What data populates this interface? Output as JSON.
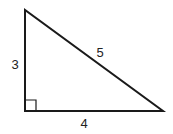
{
  "diagram": {
    "type": "right-triangle",
    "stroke_color": "#1a1a1a",
    "background": "#ffffff",
    "vertices": {
      "top": {
        "x": 25,
        "y": 10
      },
      "right_angle": {
        "x": 25,
        "y": 111
      },
      "right": {
        "x": 163,
        "y": 111
      }
    },
    "right_angle_marker": {
      "size": 11
    },
    "labels": {
      "vertical_leg": "3",
      "horizontal_leg": "4",
      "hypotenuse": "5"
    }
  }
}
